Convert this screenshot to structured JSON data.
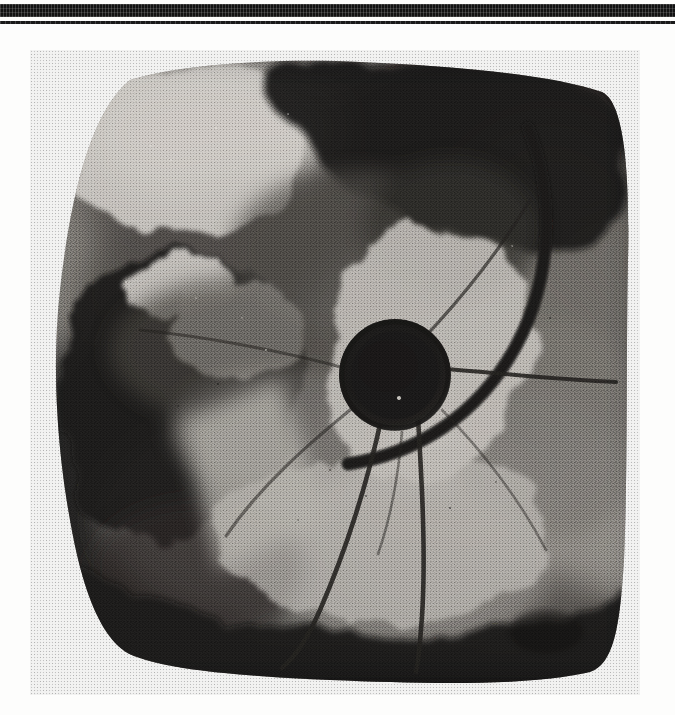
{
  "page": {
    "kind": "scanned-document-page",
    "background_color": "#fdfdfc",
    "width": 675,
    "height": 715
  },
  "rules": {
    "thick_rule_color": "#121212",
    "thin_rule_color": "#1a1a1a"
  },
  "figure": {
    "name": "radiograph-plate",
    "ink_color": "#0d0d0d",
    "paper_color": "#ffffff",
    "plate_bounds": {
      "x": 30,
      "y": 50,
      "width": 610,
      "height": 645
    },
    "features": [
      {
        "name": "central-hub",
        "label": "dark circular hub",
        "cx": 370,
        "cy": 330,
        "r": 52,
        "tone": "darkest"
      },
      {
        "name": "hub-ring",
        "label": "faint ring outline around hub",
        "tone": "dark"
      },
      {
        "name": "hub-highlight",
        "label": "tiny bright point inside hub",
        "x": 374,
        "y": 352
      },
      {
        "name": "hook-arc",
        "label": "heavy curved arc / hook, upper right",
        "tone": "darkest"
      },
      {
        "name": "wire-1",
        "label": "thin wire curving down-left to bottom edge",
        "tone": "dark"
      },
      {
        "name": "wire-2",
        "label": "thin wire curving down to bottom edge",
        "tone": "dark"
      },
      {
        "name": "wire-3",
        "label": "thin near-horizontal wire to right edge",
        "tone": "dark"
      },
      {
        "name": "wire-4",
        "label": "thin wire toward upper right",
        "tone": "dark"
      },
      {
        "name": "wire-5",
        "label": "thin wire toward lower left",
        "tone": "dark"
      },
      {
        "name": "bright-notch-left",
        "label": "bright pale notch on left margin",
        "tone": "lightest"
      },
      {
        "name": "bright-wedge-upper-left",
        "label": "pale wedge at top left of plate",
        "tone": "light"
      },
      {
        "name": "bright-lobe-lower-right",
        "label": "pale lobe right of centre",
        "tone": "light"
      },
      {
        "name": "dark-lobe-left",
        "label": "dark lobe protruding on the left",
        "tone": "darkest"
      },
      {
        "name": "dark-mass-top-right",
        "label": "dense black mass across the top right",
        "tone": "darkest"
      },
      {
        "name": "dark-band-bottom",
        "label": "dense black ragged band along the bottom",
        "tone": "darkest"
      },
      {
        "name": "oval-blob-bottom-right",
        "label": "small rounded dark oval, lower right",
        "cx": 545,
        "cy": 632,
        "rx": 36,
        "ry": 20
      }
    ],
    "tones": {
      "lightest": "#f4f2ee",
      "light": "#cfccc6",
      "mid": "#8e8b86",
      "dark": "#4a4744",
      "darkest": "#121110"
    }
  }
}
